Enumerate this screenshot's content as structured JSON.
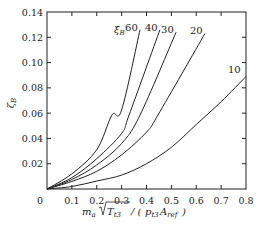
{
  "chart_data": {
    "type": "line",
    "title": "",
    "xlabel": "m_a √T_t3 / (p_t3 A_ref)",
    "ylabel": "ζ_B",
    "xlim": [
      0,
      0.8
    ],
    "ylim": [
      0,
      0.14
    ],
    "xticks": [
      "0",
      "0.1",
      "0.2",
      "0.3",
      "0.4",
      "0.5",
      "0.6",
      "0.7",
      "0.8"
    ],
    "yticks": [
      "0.02",
      "0.04",
      "0.06",
      "0.08",
      "0.10",
      "0.12",
      "0.14"
    ],
    "grid": false,
    "legend_title": "ξ_B",
    "series": [
      {
        "name": "60",
        "x": [
          0,
          0.1,
          0.2,
          0.261,
          0.3,
          0.374
        ],
        "y": [
          0,
          0.012,
          0.031,
          0.0585,
          0.0625,
          0.126
        ]
      },
      {
        "name": "40",
        "x": [
          0,
          0.1,
          0.2,
          0.3,
          0.33,
          0.454
        ],
        "y": [
          0,
          0.009,
          0.024,
          0.044,
          0.0585,
          0.126
        ]
      },
      {
        "name": "30",
        "x": [
          0,
          0.1,
          0.2,
          0.3,
          0.374,
          0.519
        ],
        "y": [
          0,
          0.0075,
          0.019,
          0.036,
          0.0585,
          0.124
        ]
      },
      {
        "name": "20",
        "x": [
          0,
          0.1,
          0.2,
          0.3,
          0.4,
          0.446,
          0.635
        ],
        "y": [
          0,
          0.006,
          0.014,
          0.027,
          0.045,
          0.0585,
          0.123
        ]
      },
      {
        "name": "10",
        "x": [
          0,
          0.1,
          0.2,
          0.3,
          0.4,
          0.5,
          0.6,
          0.7,
          0.8
        ],
        "y": [
          0,
          0.002,
          0.0063,
          0.011,
          0.02,
          0.033,
          0.051,
          0.069,
          0.089
        ]
      }
    ]
  },
  "labels": {
    "legend_symbol": "ξ",
    "legend_sub": "B",
    "y_symbol": "ζ",
    "y_sub": "B",
    "x_m": "m",
    "x_m_sub": "a",
    "x_T": "T",
    "x_T_sub": "t3",
    "x_mid": "/ (",
    "x_p": "p",
    "x_p_sub": "t3",
    "x_A": "A",
    "x_A_sub": "ref",
    "x_close": ")"
  }
}
